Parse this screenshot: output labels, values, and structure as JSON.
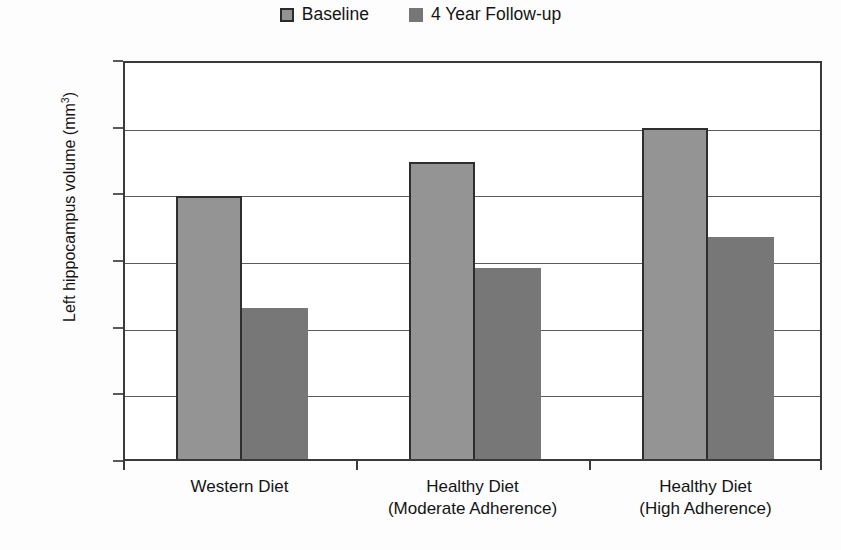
{
  "chart_data": {
    "type": "bar",
    "title": "",
    "xlabel": "",
    "ylabel": "Left hippocampus volume (mm3)",
    "ylabel_base": "Left hippocampus volume (mm",
    "ylabel_sup": "3",
    "ylabel_close": ")",
    "categories": [
      {
        "line1": "Western Diet",
        "line2": ""
      },
      {
        "line1": "Healthy Diet",
        "line2": "(Moderate Adherence)"
      },
      {
        "line1": "Healthy Diet",
        "line2": "(High Adherence)"
      }
    ],
    "series": [
      {
        "name": "Baseline",
        "color": "#949494",
        "values": [
          2788,
          2890,
          2992
        ]
      },
      {
        "name": "4 Year Follow-up",
        "color": "#777777",
        "values": [
          2454,
          2573,
          2666
        ]
      }
    ],
    "ylim": [
      2000,
      3200
    ],
    "ytick_step": 200,
    "yticks": [
      "3200",
      "3000",
      "2800",
      "2600",
      "2400",
      "2200",
      "2000"
    ],
    "grid": true,
    "legend_position": "top-center"
  },
  "legend": {
    "entries": [
      {
        "label": "Baseline",
        "swatch": "baseline-swatch"
      },
      {
        "label": "4 Year Follow-up",
        "swatch": "followup-swatch"
      }
    ]
  }
}
